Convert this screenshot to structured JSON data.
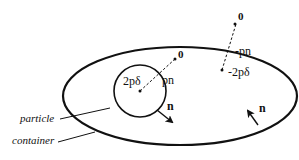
{
  "labels": {
    "inner_zero": "0",
    "inner_2pdelta": "2pδ",
    "inner_pn": "pn",
    "inner_n": "n",
    "outer_zero": "0",
    "outer_minus_pn": "-pn",
    "outer_minus_2pdelta": "-2pδ",
    "outer_n": "n",
    "particle": "particle",
    "container": "container"
  },
  "colors": {
    "stroke": "#111111",
    "background": "#ffffff"
  }
}
